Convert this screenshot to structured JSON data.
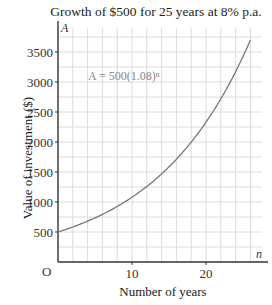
{
  "chart_data": {
    "type": "line",
    "title": "Growth of $500 for 25 years at 8% p.a.",
    "xlabel": "Number of years",
    "ylabel": "Value of investment ($)",
    "x_axis_symbol": "n",
    "y_axis_symbol": "A",
    "origin_label": "O",
    "annotation": "A = 500(1.08)ⁿ",
    "x_ticks": [
      10,
      20
    ],
    "y_ticks": [
      500,
      1000,
      1500,
      2000,
      2500,
      3000,
      3500
    ],
    "xlim": [
      0,
      28
    ],
    "ylim": [
      0,
      3900
    ],
    "grid": true,
    "series": [
      {
        "name": "A = 500(1.08)^n",
        "x": [
          0,
          2,
          4,
          6,
          8,
          10,
          12,
          14,
          16,
          18,
          20,
          22,
          24,
          26
        ],
        "values": [
          500,
          583,
          680,
          793,
          925,
          1079,
          1259,
          1469,
          1713,
          1998,
          2330,
          2718,
          3171,
          3699
        ]
      }
    ]
  }
}
